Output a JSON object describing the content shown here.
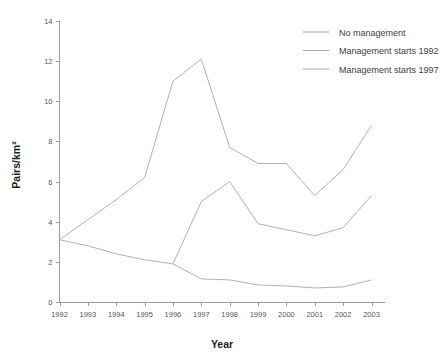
{
  "chart_data": {
    "type": "line",
    "title": "",
    "xlabel": "Year",
    "ylabel": "Pairs/km²",
    "x": [
      1992,
      1993,
      1994,
      1995,
      1996,
      1997,
      1998,
      1999,
      2000,
      2001,
      2002,
      2003
    ],
    "categories": [
      "1992",
      "1993",
      "1994",
      "1995",
      "1996",
      "1997",
      "1998",
      "1999",
      "2000",
      "2001",
      "2002",
      "2003"
    ],
    "xlim": [
      1992,
      2003
    ],
    "ylim": [
      0,
      14
    ],
    "yticks": [
      0,
      2,
      4,
      6,
      8,
      10,
      12,
      14
    ],
    "yticklabels": [
      "0",
      "2",
      "4",
      "6",
      "8",
      "10",
      "12",
      "14"
    ],
    "xticks": [
      1992,
      1993,
      1994,
      1995,
      1996,
      1997,
      1998,
      1999,
      2000,
      2001,
      2002,
      2003
    ],
    "xticklabels": [
      "1992",
      "1993",
      "1994",
      "1995",
      "1996",
      "1997",
      "1998",
      "1999",
      "2000",
      "2001",
      "2002",
      "2003"
    ],
    "grid": false,
    "legend_position": "top-right",
    "series": [
      {
        "name": "No management",
        "color": "#a9a9a9",
        "x": [
          1992,
          1993,
          1994,
          1995,
          1996,
          1997,
          1998,
          1999,
          2000,
          2001,
          2002,
          2003
        ],
        "values": [
          3.1,
          4.1,
          5.1,
          6.2,
          11.0,
          12.1,
          7.7,
          6.9,
          6.9,
          5.3,
          6.6,
          8.8
        ]
      },
      {
        "name": "Management starts 1992",
        "color": "#a9a9a9",
        "x": [
          1992,
          1993,
          1994,
          1995,
          1996,
          1997,
          1998,
          1999,
          2000,
          2001,
          2002,
          2003
        ],
        "values": [
          3.1,
          2.8,
          2.4,
          2.1,
          1.9,
          1.15,
          1.1,
          0.85,
          0.8,
          0.7,
          0.75,
          1.1
        ]
      },
      {
        "name": "Management starts 1997",
        "color": "#a9a9a9",
        "x": [
          1996,
          1997,
          1998,
          1999,
          2000,
          2001,
          2002,
          2003
        ],
        "values": [
          1.9,
          5.0,
          6.0,
          3.9,
          3.6,
          3.3,
          3.7,
          5.3
        ]
      }
    ]
  },
  "legend": {
    "items": [
      {
        "label": "No management",
        "color": "#a9a9a9"
      },
      {
        "label": "Management starts 1992",
        "color": "#a9a9a9"
      },
      {
        "label": "Management starts 1997",
        "color": "#a9a9a9"
      }
    ]
  },
  "axes": {
    "x_title": "Year",
    "y_title": "Pairs/km²"
  }
}
